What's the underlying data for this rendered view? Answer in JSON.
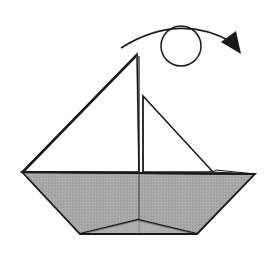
{
  "diagram": {
    "colors": {
      "background": "#ffffff",
      "line": "#1a1a1a",
      "hull_fill": "#a6a6a6",
      "sail_fill": "#ffffff"
    },
    "symbols": {
      "turn_over": "turn-over-arrow"
    }
  }
}
